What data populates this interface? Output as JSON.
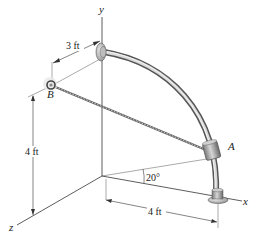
{
  "figure": {
    "axes": {
      "x_label": "x",
      "y_label": "y",
      "z_label": "z"
    },
    "points": {
      "a_label": "A",
      "b_label": "B"
    },
    "dimensions": {
      "top_horizontal": "3 ft",
      "left_vertical": "4 ft",
      "bottom_horizontal": "4 ft",
      "angle": "20°"
    },
    "colors": {
      "line": "#333333",
      "rod": "#8a8a8a",
      "rod_highlight": "#d8d8d8",
      "collar": "#9a9a9a",
      "cable": "#777777"
    }
  }
}
